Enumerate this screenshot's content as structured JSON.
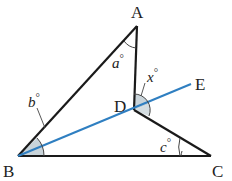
{
  "diagram": {
    "points": {
      "A": {
        "label": "A",
        "x": 137,
        "y": 26
      },
      "B": {
        "label": "B",
        "x": 18,
        "y": 156
      },
      "C": {
        "label": "C",
        "x": 211,
        "y": 156
      },
      "D": {
        "label": "D",
        "x": 134,
        "y": 110
      },
      "E": {
        "label": "E",
        "x": 191,
        "y": 84
      }
    },
    "angles": {
      "a": {
        "label": "a",
        "degree": "°"
      },
      "b": {
        "label": "b",
        "degree": "°"
      },
      "c": {
        "label": "c",
        "degree": "°"
      },
      "x": {
        "label": "x",
        "degree": "°"
      }
    },
    "colors": {
      "line": "#1a1a1a",
      "ray": "#2f7fc1",
      "shade": "#c9d4da"
    }
  }
}
